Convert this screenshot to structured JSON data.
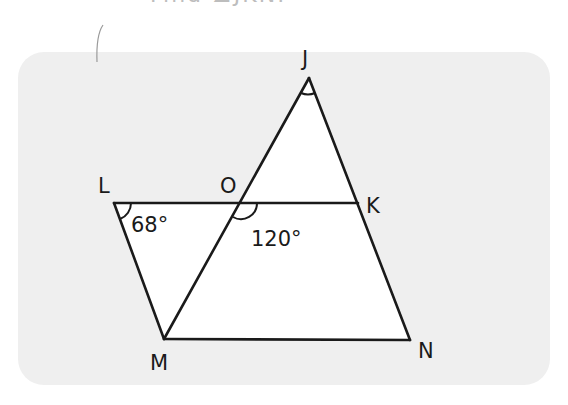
{
  "heading_fragment": "Find ∠JKN.",
  "points": {
    "J": {
      "label": "J",
      "x": 309,
      "y": 78,
      "lx": 302,
      "ly": 66
    },
    "L": {
      "label": "L",
      "x": 114,
      "y": 203,
      "lx": 98,
      "ly": 193
    },
    "O": {
      "label": "O",
      "x": 241,
      "y": 203,
      "lx": 220,
      "ly": 193
    },
    "K": {
      "label": "K",
      "x": 358,
      "y": 203,
      "lx": 366,
      "ly": 213
    },
    "M": {
      "label": "M",
      "x": 164,
      "y": 339,
      "lx": 150,
      "ly": 370
    },
    "N": {
      "label": "N",
      "x": 410,
      "y": 340,
      "lx": 418,
      "ly": 358
    }
  },
  "angles": [
    {
      "name": "angle-L",
      "label": "68°",
      "x": 131,
      "y": 232
    },
    {
      "name": "angle-O",
      "label": "120°",
      "x": 251,
      "y": 246
    },
    {
      "name": "angle-J",
      "label": "",
      "x": 0,
      "y": 0
    }
  ],
  "segments": [
    "LK",
    "LM",
    "MN",
    "MJ",
    "JN"
  ],
  "colors": {
    "line": "#1a1a1a",
    "panel": "#efefef",
    "triangle_fill": "#ffffff"
  }
}
